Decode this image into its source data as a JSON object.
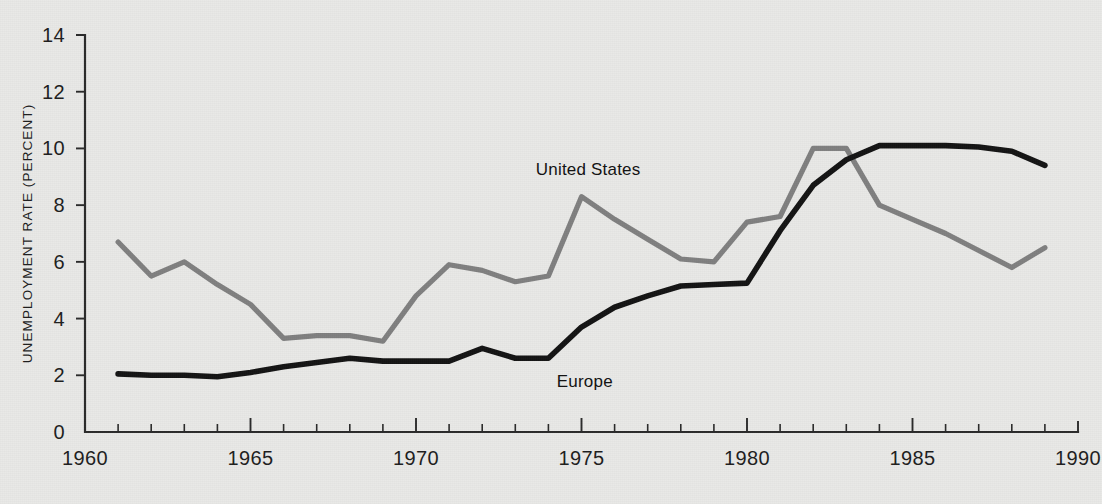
{
  "figure": {
    "background_color": "#e9e9e7",
    "plot_left": 85,
    "plot_right": 1078,
    "plot_top": 35,
    "plot_bottom": 432
  },
  "chart_data": {
    "type": "line",
    "title": "",
    "subtitle": "",
    "xlabel": "",
    "ylabel": "UNEMPLOYMENT RATE (PERCENT)",
    "xlim": [
      1960,
      1990
    ],
    "ylim": [
      0,
      14
    ],
    "grid": false,
    "legend_position": "inline-annotation",
    "y_ticks": [
      0,
      2,
      4,
      6,
      8,
      10,
      12,
      14
    ],
    "y_tick_labels": [
      "0",
      "2",
      "4",
      "6",
      "8",
      "10",
      "12",
      "14"
    ],
    "x_ticks_major": [
      1960,
      1965,
      1970,
      1975,
      1980,
      1985,
      1990
    ],
    "x_tick_labels": [
      "1960",
      "1965",
      "1970",
      "1975",
      "1980",
      "1985",
      "1990"
    ],
    "x_ticks_minor_step": 1,
    "x": [
      1961,
      1962,
      1963,
      1964,
      1965,
      1966,
      1967,
      1968,
      1969,
      1970,
      1971,
      1972,
      1973,
      1974,
      1975,
      1976,
      1977,
      1978,
      1979,
      1980,
      1981,
      1982,
      1983,
      1984,
      1985,
      1986,
      1987,
      1988,
      1989
    ],
    "series": [
      {
        "name": "United States",
        "color": "#808080",
        "line_width": 5.2,
        "label_x": 1975.2,
        "label_y": 9.05,
        "values": [
          6.7,
          5.5,
          6.0,
          5.2,
          4.5,
          3.3,
          3.4,
          3.4,
          3.2,
          4.8,
          5.9,
          5.7,
          5.3,
          5.5,
          8.3,
          7.5,
          6.8,
          6.1,
          6.0,
          7.4,
          7.6,
          10.0,
          10.0,
          8.0,
          7.5,
          7.0,
          6.4,
          5.8,
          6.5
        ]
      },
      {
        "name": "Europe",
        "color": "#131313",
        "line_width": 5.6,
        "label_x": 1975.1,
        "label_y": 1.6,
        "values": [
          2.05,
          2.0,
          2.0,
          1.95,
          2.1,
          2.3,
          2.45,
          2.6,
          2.5,
          2.5,
          2.5,
          2.95,
          2.6,
          2.6,
          3.7,
          4.4,
          4.8,
          5.15,
          5.2,
          5.25,
          7.1,
          8.7,
          9.6,
          10.1,
          10.1,
          10.1,
          10.05,
          9.9,
          9.4
        ]
      }
    ]
  }
}
